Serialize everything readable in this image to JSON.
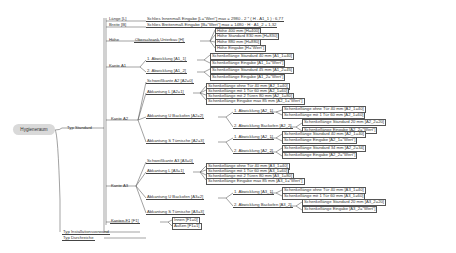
{
  "root": {
    "label": "Hygieneraum"
  },
  "branches": {
    "standard": {
      "label": "Typ Standard"
    },
    "installation": {
      "label": "Typ Installationsvorwand"
    },
    "durchreiche": {
      "label": "Typ Durchreiche"
    }
  },
  "standard_children": {
    "laenge": {
      "label": "Länge [L]",
      "formula": "Schlies Innenmaß Eingabe [L=\"Wert\"] max = 2980 - 2 * ( H - A1_1 ) : 6,77"
    },
    "breite": {
      "label": "Breite [B]",
      "formula": "Schlies Breitenmaß Eingabe [B=\"Wert\"] max = 1480 · H · A1_2 + 1,32"
    },
    "hoehe": {
      "label": "Höhe",
      "group": "Oberschrank Unterbau [H]",
      "options": [
        "Höhe 400 mm [H=400]",
        "Höhe Standard 830 mm [H=830]",
        "Höhe 880 mm [H=880]",
        "Höhe Eingabe [H=\"Wert\"]"
      ]
    },
    "kante_a1": {
      "label": "Kante A1",
      "abwicklungen": [
        {
          "label": "1. Abwicklung [A1_1]",
          "options": [
            "Schenkellänge Standard 40 mm [A1_1=40]",
            "Schenkellänge Eingabe [A1_1=\"Wert\"]"
          ]
        },
        {
          "label": "2. Abwicklung [A1_2]",
          "options": [
            "Schenkellänge Standard 45 mm [A1_2=45]",
            "Schenkellänge Eingabe [A1_2=\"Wert\"]"
          ]
        }
      ]
    },
    "kante_a2": {
      "label": "Kante A2",
      "schweisskante": "Schweißkante A2 [A2=0]",
      "abkantung_l": {
        "label": "Abkantung L [A2=1]",
        "options": [
          "Schenkellänge ohne Tür 40 mm [A2_1=40]",
          "Schenkellänge mit 1 Tür 60 mm [A2_1=60]",
          "Schenkellänge mit 2 Türen 80 mm [A2_1=80]",
          "Schenkellänge Eingabe max 85 mm [A2_1=\"Wert\"]"
        ]
      },
      "abkantung_u": {
        "label": "Abkantung U Backofen [A2=2]",
        "sub": [
          {
            "label": "1. Abwicklung [A2_1]",
            "options": [
              "Schenkellänge ohne Tür 40 mm [A2_1=40]",
              "Schenkellänge mit 1 Tür 60 mm [A2_1=60]"
            ]
          },
          {
            "label": "2. Abwicklung Backofen [A2_2]",
            "options": [
              "Schenkellänge Standard 20 mm [A2_2=20]",
              "Schenkellänge Eingabe [A2_2=\"Wert\"]"
            ]
          }
        ]
      },
      "abkantung_s": {
        "label": "Abkantung S Türnische [A2=3]",
        "sub": [
          {
            "label": "1. Abwicklung [A2_1]",
            "options": [
              "Schenkellänge Standard 40 mm [A2_1=40]",
              "Schenkellänge Eingabe [A2_1=\"Wert\"]"
            ]
          },
          {
            "label": "2. Abwicklung [A2_2]",
            "options": [
              "Schenkellänge Standard 34 mm [A2_2=34]",
              "Schenkellänge Eingabe [A2_2=\"Wert\"]"
            ]
          }
        ]
      }
    },
    "kante_a3": {
      "label": "Kante A3",
      "schweisskante": "Schweißkante A3 [A3=0]",
      "abkantung_l": {
        "label": "Abkantung L [A3=1]",
        "options": [
          "Schenkellänge ohne Tür 40 mm [A3_1=40]",
          "Schenkellänge mit 1 Tür 60 mm [A3_1=60]",
          "Schenkellänge mit 2 Türen 80 mm [A3_1=80]",
          "Schenkellänge Eingabe max 85 mm [A3_1=\"Wert\"]"
        ]
      },
      "abkantung_u": {
        "label": "Abkantung U Backofen [A3=2]",
        "sub": [
          {
            "label": "1. Abwicklung [A3_1]",
            "options": [
              "Schenkellänge ohne Tür 40 mm [A3_1=40]",
              "Schenkellänge mit 1 Tür 60 mm [A3_1=60]"
            ]
          },
          {
            "label": "2. Abwicklung Backofen [A3_2]",
            "options": [
              "Schenkellänge Standard 20 mm [A3_2=20]",
              "Schenkellänge Eingabe [A3_2=\"Wert\"]"
            ]
          }
        ]
      },
      "abkantung_s": {
        "label": "Abkantung S Türnische [A3=3]"
      }
    },
    "kanten_f1": {
      "label": "Kanten F1 [F1]",
      "options": [
        "Innen [F1=0]",
        "Außen [F1=1]"
      ]
    }
  }
}
